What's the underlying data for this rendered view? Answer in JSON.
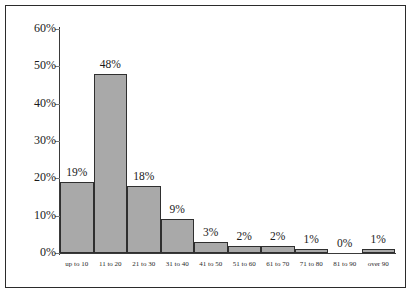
{
  "chart_data": {
    "type": "bar",
    "title": "",
    "subtitle": "",
    "xlabel": "",
    "ylabel": "",
    "categories": [
      "up to 10",
      "11 to 20",
      "21 to 30",
      "31 to 40",
      "41 to 50",
      "51 to 60",
      "61 to 70",
      "71 to 80",
      "81 to 90",
      "over 90"
    ],
    "values": [
      19,
      48,
      18,
      9,
      3,
      2,
      2,
      1,
      0,
      1
    ],
    "value_labels": [
      "19%",
      "48%",
      "18%",
      "9%",
      "3%",
      "2%",
      "2%",
      "1%",
      "0%",
      "1%"
    ],
    "ylim": [
      0,
      60
    ],
    "y_ticks": [
      0,
      10,
      20,
      30,
      40,
      50,
      60
    ],
    "y_tick_labels": [
      "0%",
      "10%",
      "20%",
      "30%",
      "40%",
      "50%",
      "60%"
    ],
    "grid": false,
    "legend": null,
    "bar_fill_color": "#a9a9a9",
    "bar_border_color": "#2f2f2f",
    "axis_color": "#3a3a3a",
    "frame_color": "#2b2b2b",
    "text_color": "#1a1a1a",
    "background_color": "#ffffff",
    "bar_gap": 0
  }
}
